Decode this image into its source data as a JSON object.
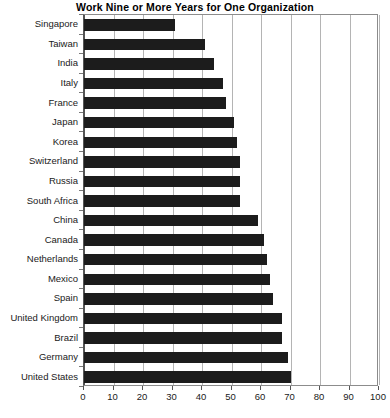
{
  "chart_data": {
    "type": "bar",
    "orientation": "horizontal",
    "title": "Work Nine or More Years for One Organization",
    "xlabel": "",
    "ylabel": "",
    "xlim": [
      0,
      100
    ],
    "xticks": [
      0,
      10,
      20,
      30,
      40,
      50,
      60,
      70,
      80,
      90,
      100
    ],
    "grid": true,
    "legend": false,
    "bar_color": "#1c1c1c",
    "grid_color": "#b4b4b4",
    "axis_color": "#555555",
    "categories": [
      "Singapore",
      "Taiwan",
      "India",
      "Italy",
      "France",
      "Japan",
      "Korea",
      "Switzerland",
      "Russia",
      "South Africa",
      "China",
      "Canada",
      "Netherlands",
      "Mexico",
      "Spain",
      "United Kingdom",
      "Brazil",
      "Germany",
      "United States"
    ],
    "values": [
      31,
      41,
      44,
      47,
      48,
      51,
      52,
      53,
      53,
      53,
      59,
      61,
      62,
      63,
      64,
      67,
      67,
      69,
      70
    ]
  }
}
